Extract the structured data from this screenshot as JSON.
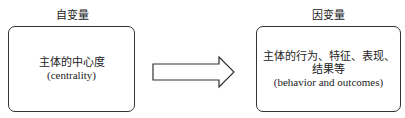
{
  "left": {
    "title": "自变量",
    "line1": "主体的中心度",
    "line2": "(centrality)"
  },
  "right": {
    "title": "因变量",
    "line1": "主体的行为、特征、表现、",
    "line2": "结果等",
    "line3": "(behavior and outcomes)"
  },
  "arrow": {
    "icon": "right-block-arrow-icon",
    "color": "#333333"
  }
}
